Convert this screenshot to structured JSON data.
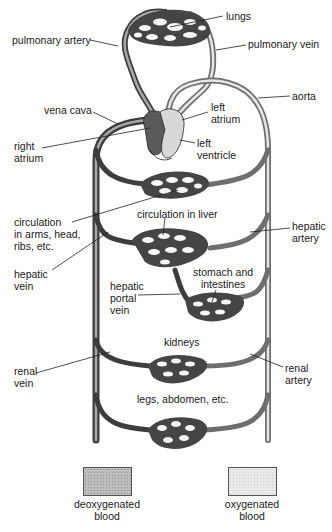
{
  "diagram": {
    "labels": {
      "lungs": "lungs",
      "pulmonary_artery": "pulmonary artery",
      "pulmonary_vein": "pulmonary vein",
      "aorta": "aorta",
      "vena_cava": "vena cava",
      "left_atrium_1": "left",
      "left_atrium_2": "atrium",
      "right_atrium_1": "right",
      "right_atrium_2": "atrium",
      "left_ventricle_1": "left",
      "left_ventricle_2": "ventricle",
      "circulation_arms_1": "circulation",
      "circulation_arms_2": "in arms, head,",
      "circulation_arms_3": "ribs, etc.",
      "circulation_liver": "circulation in liver",
      "hepatic_artery_1": "hepatic",
      "hepatic_artery_2": "artery",
      "hepatic_vein_1": "hepatic",
      "hepatic_vein_2": "vein",
      "stomach_1": "stomach and",
      "stomach_2": "intestines",
      "hepatic_portal_1": "hepatic",
      "hepatic_portal_2": "portal",
      "hepatic_portal_3": "vein",
      "kidneys": "kidneys",
      "renal_vein_1": "renal",
      "renal_vein_2": "vein",
      "renal_artery_1": "renal",
      "renal_artery_2": "artery",
      "legs": "legs, abdomen, etc."
    },
    "legend": [
      {
        "key": "deoxygenated",
        "line1": "deoxygenated",
        "line2": "blood",
        "color": "#bdbdbd"
      },
      {
        "key": "oxygenated",
        "line1": "oxygenated",
        "line2": "blood",
        "color": "#e9e9e9"
      }
    ]
  }
}
